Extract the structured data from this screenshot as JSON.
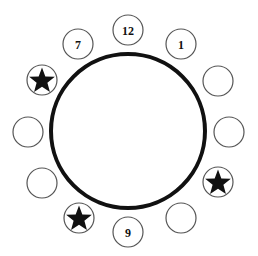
{
  "diagram": {
    "colors": {
      "background": "#ffffff",
      "table_stroke": "#111111",
      "seat_stroke": "#555555",
      "star_fill": "#111111",
      "label": "#111111"
    },
    "table": {
      "cx": 128,
      "cy": 131,
      "r": 77,
      "stroke_width": 4
    },
    "seat_radius": 15,
    "seats": [
      {
        "id": "seat-top",
        "cx": 128,
        "cy": 30,
        "label": "12",
        "marker": "none"
      },
      {
        "id": "seat-upper-right",
        "cx": 181,
        "cy": 44,
        "label": "1",
        "marker": "none"
      },
      {
        "id": "seat-right-1",
        "cx": 218,
        "cy": 81,
        "label": "",
        "marker": "none"
      },
      {
        "id": "seat-right-2",
        "cx": 229,
        "cy": 132,
        "label": "",
        "marker": "none"
      },
      {
        "id": "seat-right-3",
        "cx": 218,
        "cy": 182,
        "label": "",
        "marker": "star"
      },
      {
        "id": "seat-lower-right",
        "cx": 181,
        "cy": 218,
        "label": "",
        "marker": "none"
      },
      {
        "id": "seat-bottom",
        "cx": 128,
        "cy": 232,
        "label": "9",
        "marker": "none"
      },
      {
        "id": "seat-lower-left",
        "cx": 79,
        "cy": 218,
        "label": "",
        "marker": "star"
      },
      {
        "id": "seat-left-3",
        "cx": 42,
        "cy": 183,
        "label": "",
        "marker": "none"
      },
      {
        "id": "seat-left-2",
        "cx": 28,
        "cy": 132,
        "label": "",
        "marker": "none"
      },
      {
        "id": "seat-left-1",
        "cx": 42,
        "cy": 80,
        "label": "",
        "marker": "star"
      },
      {
        "id": "seat-upper-left",
        "cx": 78,
        "cy": 44,
        "label": "7",
        "marker": "none"
      }
    ]
  }
}
